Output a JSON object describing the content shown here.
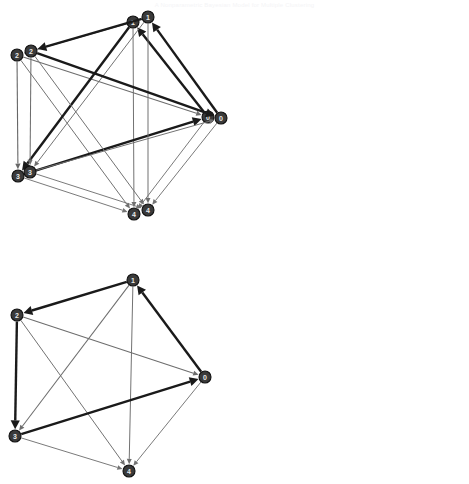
{
  "caption": {
    "text": "A Nonparametric Bayesian Model for Multiple Clustering"
  },
  "figure": {
    "type": "directed-graph-panels",
    "panel_count": 3,
    "node_ids": [
      "0",
      "1",
      "2",
      "3",
      "4"
    ],
    "node_radius": 6,
    "colors": {
      "node_fill": "#3a3a3a",
      "node_stroke": "#111111",
      "node_label": "#e9e9e9",
      "edge_strong": "#1a1a1a",
      "edge_weak": "#b9b9b9",
      "background": "#ffffff"
    },
    "edge_weight_legend": {
      "strong": "thick dark edge (high weight)",
      "medium": "medium grey edge",
      "weak": "thin light grey edge (low weight)"
    }
  },
  "panels": [
    {
      "name": "panel-1",
      "origin": {
        "x": 0,
        "y": 8
      },
      "width": 232,
      "height": 232,
      "nodes": [
        {
          "id": "0",
          "label": "0",
          "x": 208,
          "y": 117
        },
        {
          "id": "1",
          "label": "1",
          "x": 133,
          "y": 22
        },
        {
          "id": "2",
          "label": "2",
          "x": 17,
          "y": 55
        },
        {
          "id": "3",
          "label": "3",
          "x": 18,
          "y": 176
        },
        {
          "id": "4",
          "label": "4",
          "x": 134,
          "y": 214
        }
      ],
      "edges": [
        {
          "from": "1",
          "to": "2",
          "weight": 0.28
        },
        {
          "from": "1",
          "to": "3",
          "weight": 1.0
        },
        {
          "from": "0",
          "to": "1",
          "weight": 1.0
        },
        {
          "from": "3",
          "to": "0",
          "weight": 1.0
        },
        {
          "from": "2",
          "to": "0",
          "weight": 0.26
        },
        {
          "from": "2",
          "to": "3",
          "weight": 0.3
        },
        {
          "from": "2",
          "to": "4",
          "weight": 0.24
        },
        {
          "from": "1",
          "to": "4",
          "weight": 0.24
        },
        {
          "from": "3",
          "to": "4",
          "weight": 0.22
        },
        {
          "from": "0",
          "to": "4",
          "weight": 0.22
        }
      ]
    },
    {
      "name": "panel-2",
      "origin": {
        "x": 240,
        "y": 6
      },
      "width": 229,
      "height": 232,
      "nodes": [
        {
          "id": "0",
          "label": "0",
          "x": 221,
          "y": 118
        },
        {
          "id": "1",
          "label": "1",
          "x": 148,
          "y": 17
        },
        {
          "id": "2",
          "label": "2",
          "x": 31,
          "y": 51
        },
        {
          "id": "3",
          "label": "3",
          "x": 30,
          "y": 172
        },
        {
          "id": "4",
          "label": "4",
          "x": 148,
          "y": 210
        }
      ],
      "edges": [
        {
          "from": "1",
          "to": "2",
          "weight": 1.0
        },
        {
          "from": "2",
          "to": "0",
          "weight": 1.0
        },
        {
          "from": "0",
          "to": "1",
          "weight": 1.0
        },
        {
          "from": "1",
          "to": "3",
          "weight": 0.24
        },
        {
          "from": "2",
          "to": "3",
          "weight": 0.26
        },
        {
          "from": "2",
          "to": "4",
          "weight": 0.24
        },
        {
          "from": "1",
          "to": "4",
          "weight": 0.24
        },
        {
          "from": "3",
          "to": "0",
          "weight": 0.24
        },
        {
          "from": "3",
          "to": "4",
          "weight": 0.22
        },
        {
          "from": "0",
          "to": "4",
          "weight": 0.22
        }
      ]
    },
    {
      "name": "panel-3",
      "origin": {
        "x": 0,
        "y": 266
      },
      "width": 232,
      "height": 218,
      "nodes": [
        {
          "id": "0",
          "label": "0",
          "x": 205,
          "y": 377
        },
        {
          "id": "1",
          "label": "1",
          "x": 133,
          "y": 280
        },
        {
          "id": "2",
          "label": "2",
          "x": 17,
          "y": 315
        },
        {
          "id": "3",
          "label": "3",
          "x": 15,
          "y": 436
        },
        {
          "id": "4",
          "label": "4",
          "x": 129,
          "y": 471
        }
      ],
      "edges": [
        {
          "from": "1",
          "to": "2",
          "weight": 1.0
        },
        {
          "from": "2",
          "to": "3",
          "weight": 1.0
        },
        {
          "from": "0",
          "to": "1",
          "weight": 1.0
        },
        {
          "from": "3",
          "to": "0",
          "weight": 1.0
        },
        {
          "from": "2",
          "to": "0",
          "weight": 0.26
        },
        {
          "from": "1",
          "to": "3",
          "weight": 0.26
        },
        {
          "from": "2",
          "to": "4",
          "weight": 0.24
        },
        {
          "from": "1",
          "to": "4",
          "weight": 0.24
        },
        {
          "from": "3",
          "to": "4",
          "weight": 0.22
        },
        {
          "from": "0",
          "to": "4",
          "weight": 0.22
        }
      ]
    }
  ]
}
